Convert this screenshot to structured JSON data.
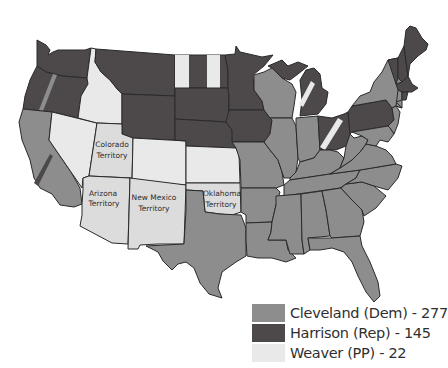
{
  "colors": {
    "dem": "#8d8d8d",
    "rep": "#4d494a",
    "pp": "#e9e9e9",
    "territory": "#dcdcdc"
  },
  "legend": [
    {
      "key": "dem",
      "label": "Cleveland (Dem) - 277",
      "candidate": "Cleveland",
      "party": "Dem",
      "electoral_votes": 277
    },
    {
      "key": "rep",
      "label": "Harrison (Rep) - 145",
      "candidate": "Harrison",
      "party": "Rep",
      "electoral_votes": 145
    },
    {
      "key": "pp",
      "label": "Weaver (PP) - 22",
      "candidate": "Weaver",
      "party": "PP",
      "electoral_votes": 22
    }
  ],
  "territories": [
    {
      "name": "Colorado Territory",
      "line1": "Colorado",
      "line2": "Territory"
    },
    {
      "name": "Arizona Territory",
      "line1": "Arizona",
      "line2": "Territory"
    },
    {
      "name": "New Mexico Territory",
      "line1": "New Mexico",
      "line2": "Territory"
    },
    {
      "name": "Oklahoma Territory",
      "line1": "Oklahoma",
      "line2": "Territory"
    }
  ],
  "states": [
    {
      "id": "WA",
      "winner": "rep"
    },
    {
      "id": "OR",
      "winner": "rep",
      "split": "dem"
    },
    {
      "id": "CA",
      "winner": "dem",
      "split": "rep"
    },
    {
      "id": "NV",
      "winner": "pp"
    },
    {
      "id": "ID",
      "winner": "pp"
    },
    {
      "id": "MT",
      "winner": "rep"
    },
    {
      "id": "WY",
      "winner": "rep"
    },
    {
      "id": "CO",
      "winner": "pp"
    },
    {
      "id": "ND",
      "winner": "rep",
      "split": "pp"
    },
    {
      "id": "SD",
      "winner": "rep"
    },
    {
      "id": "NE",
      "winner": "rep"
    },
    {
      "id": "KS",
      "winner": "pp"
    },
    {
      "id": "MN",
      "winner": "rep"
    },
    {
      "id": "IA",
      "winner": "rep"
    },
    {
      "id": "MO",
      "winner": "dem"
    },
    {
      "id": "TX",
      "winner": "dem"
    },
    {
      "id": "AR",
      "winner": "dem"
    },
    {
      "id": "LA",
      "winner": "dem"
    },
    {
      "id": "WI",
      "winner": "dem"
    },
    {
      "id": "IL",
      "winner": "dem"
    },
    {
      "id": "MI",
      "winner": "rep",
      "split": "pp"
    },
    {
      "id": "IN",
      "winner": "dem"
    },
    {
      "id": "OH",
      "winner": "rep",
      "split": "pp"
    },
    {
      "id": "KY",
      "winner": "dem"
    },
    {
      "id": "TN",
      "winner": "dem"
    },
    {
      "id": "MS",
      "winner": "dem"
    },
    {
      "id": "AL",
      "winner": "dem"
    },
    {
      "id": "GA",
      "winner": "dem"
    },
    {
      "id": "FL",
      "winner": "dem"
    },
    {
      "id": "SC",
      "winner": "dem"
    },
    {
      "id": "NC",
      "winner": "dem"
    },
    {
      "id": "VA",
      "winner": "dem"
    },
    {
      "id": "WV",
      "winner": "dem"
    },
    {
      "id": "PA",
      "winner": "rep"
    },
    {
      "id": "NY",
      "winner": "dem"
    },
    {
      "id": "NJ",
      "winner": "dem"
    },
    {
      "id": "DE",
      "winner": "dem"
    },
    {
      "id": "MD",
      "winner": "dem"
    },
    {
      "id": "CT",
      "winner": "dem"
    },
    {
      "id": "RI",
      "winner": "rep"
    },
    {
      "id": "MA",
      "winner": "rep"
    },
    {
      "id": "VT",
      "winner": "rep"
    },
    {
      "id": "NH",
      "winner": "rep"
    },
    {
      "id": "ME",
      "winner": "rep"
    }
  ]
}
